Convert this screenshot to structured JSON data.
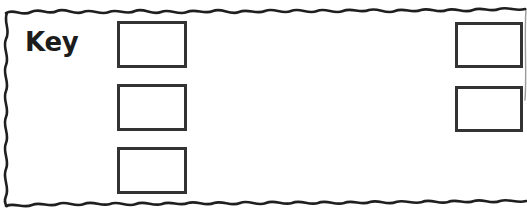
{
  "panel": {
    "name": "key-legend-panel",
    "border_style": "wavy-torn-hand-drawn",
    "border_color": "#1f1f1f",
    "background_color": "#ffffff",
    "width": 527,
    "height": 212
  },
  "label": {
    "text": "Key",
    "color": "#1c1c1c",
    "bold": true
  },
  "boxes": {
    "border_color": "#333333",
    "fill_color": "#ffffff",
    "left_column": [
      {
        "id": "key-box-1",
        "value": "",
        "x": 117,
        "y": 21,
        "width": 70,
        "height": 47
      },
      {
        "id": "key-box-2",
        "value": "",
        "x": 117,
        "y": 84,
        "width": 70,
        "height": 47
      },
      {
        "id": "key-box-3",
        "value": "",
        "x": 117,
        "y": 147,
        "width": 70,
        "height": 47
      }
    ],
    "right_column": [
      {
        "id": "key-box-4",
        "value": "",
        "x": 455,
        "y": 22,
        "width": 68,
        "height": 46
      },
      {
        "id": "key-box-5",
        "value": "",
        "x": 455,
        "y": 86,
        "width": 68,
        "height": 46
      }
    ]
  }
}
